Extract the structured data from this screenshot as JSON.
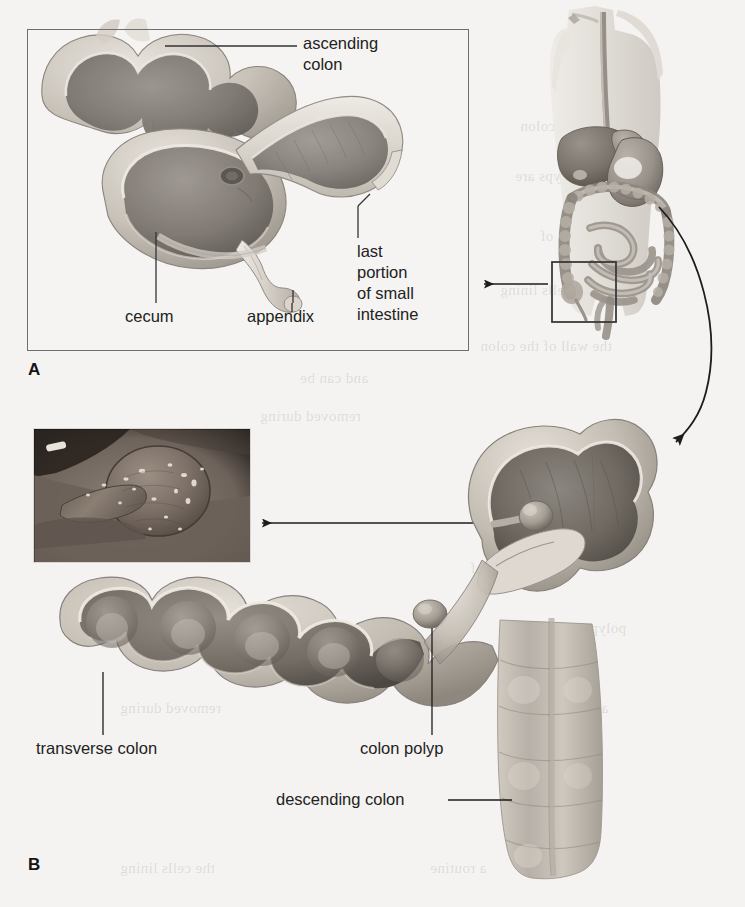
{
  "figure": {
    "type": "anatomical-illustration",
    "background_color": "#f4f3f1",
    "line_color": "#222222"
  },
  "panels": [
    {
      "letter": "A",
      "caption_letter": "A",
      "description": "Cutaway view of the cecum, appendix, ascending colon and terminal ileum",
      "framed": true
    },
    {
      "letter": "B",
      "caption_letter": "B",
      "description": "Cutaway view of transverse and descending colon showing a colon polyp",
      "framed": false
    }
  ],
  "panel_a": {
    "letter": "A",
    "labels": {
      "ascending_colon": "ascending\ncolon",
      "last_portion": "last\nportion\nof small\nintestine",
      "cecum": "cecum",
      "appendix": "appendix"
    }
  },
  "panel_b": {
    "letter": "B",
    "labels": {
      "transverse_colon": "transverse colon",
      "colon_polyp": "colon polyp",
      "descending_colon": "descending colon"
    },
    "inset": {
      "name": "endoscopic-photograph",
      "description": "Endoscopic photograph of a pedunculated colon polyp with snare"
    }
  },
  "torso": {
    "name": "human-torso-digestive-system",
    "description": "Anterior view of female torso showing esophagus, liver, stomach, small intestine and large intestine",
    "detail_box": "region of cecum and appendix"
  },
  "connectors": [
    {
      "name": "arrow-torso-to-panel-a",
      "type": "straight-arrow",
      "direction": "left"
    },
    {
      "name": "arrow-torso-to-panel-b",
      "type": "curved-arrow",
      "direction": "down-left"
    },
    {
      "name": "arrow-polyp-to-endoscopic-photo",
      "type": "straight-arrow",
      "direction": "left"
    }
  ],
  "bleed_text": [
    "the wall of the colon",
    "the cells lining",
    "grow out of",
    "polyps are",
    "Most colon",
    "and can be",
    "removed during",
    "colonoscopy",
    "a routine"
  ],
  "colors": {
    "page": "#f4f3f1",
    "ink": "#222222",
    "frame": "#6f6f6f",
    "tissue_light": "#d9d4cc",
    "tissue_mid": "#9a938c",
    "tissue_dark": "#5e5852",
    "lumen_dark": "#4a4440"
  }
}
